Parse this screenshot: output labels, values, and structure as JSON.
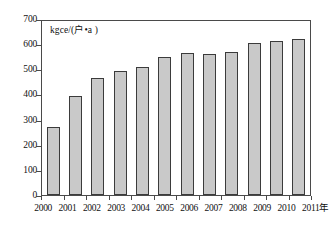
{
  "chart_data": {
    "type": "bar",
    "title": "",
    "subtitle": "",
    "xlabel": "年",
    "ylabel": "kgce/(户•a )",
    "categories": [
      "2000",
      "2001",
      "2002",
      "2003",
      "2004",
      "2005",
      "2006",
      "2007",
      "2008",
      "2009",
      "2010",
      "2011"
    ],
    "values": [
      275,
      400,
      470,
      497,
      517,
      555,
      572,
      568,
      575,
      612,
      618,
      627
    ],
    "ylim": [
      0,
      700
    ],
    "ytick_labels": [
      "700",
      "600",
      "500",
      "400",
      "300",
      "200",
      "100",
      "0"
    ],
    "ytick_values": [
      700,
      600,
      500,
      400,
      300,
      200,
      100,
      0
    ],
    "ytick_step": 100,
    "grid": false,
    "legend": null,
    "legend_position": "none",
    "series": [
      {
        "name": "单位户年均能耗",
        "values": [
          275,
          400,
          470,
          497,
          517,
          555,
          572,
          568,
          575,
          612,
          618,
          627
        ]
      }
    ],
    "annotations": []
  },
  "colors": {
    "bar_fill": "#c9c9c9",
    "bar_stroke": "#3b3b3b",
    "axis": "#4a4a4a",
    "text": "#111111",
    "background": "#ffffff"
  }
}
